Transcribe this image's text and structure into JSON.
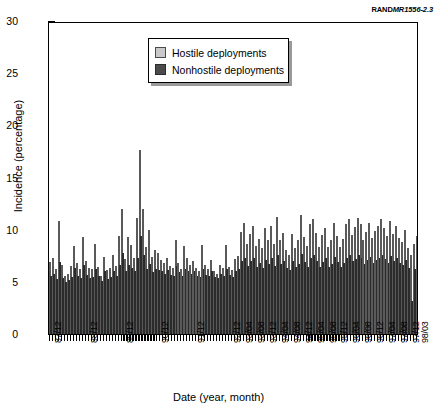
{
  "source_label": {
    "prefix": "RAND",
    "italic": "MR1556-2.3"
  },
  "chart_data": {
    "type": "bar",
    "title": "",
    "xlabel": "Date (year, month)",
    "ylabel": "Incidence (percentage)",
    "ylim": [
      0,
      30
    ],
    "ytick_labels": [
      "0",
      "5",
      "10",
      "15",
      "20",
      "25",
      "30"
    ],
    "ytick_values": [
      0,
      5,
      10,
      15,
      20,
      25,
      30
    ],
    "grid": false,
    "legend_position": "upper center",
    "legend": [
      "Hostile deployments",
      "Nonhostile deployments"
    ],
    "colors": {
      "hostile": "#c9c9c9",
      "nonhostile": "#4a4a4a"
    },
    "xtick_labels": [
      "87/12",
      "88/12",
      "89/12",
      "90/12",
      "91/12",
      "92/12",
      "93/04",
      "93/08",
      "93/12",
      "94/04",
      "94/08",
      "94/12",
      "95/04",
      "95/08",
      "95/12",
      "96/04",
      "96/08",
      "96/12",
      "97/04",
      "97/08",
      "97/12",
      "98/03"
    ],
    "categories": [
      "87/12",
      "88/01",
      "88/02",
      "88/03",
      "88/04",
      "88/05",
      "88/06",
      "88/07",
      "88/08",
      "88/09",
      "88/10",
      "88/11",
      "88/12",
      "89/01",
      "89/02",
      "89/03",
      "89/04",
      "89/05",
      "89/06",
      "89/07",
      "89/08",
      "89/09",
      "89/10",
      "89/11",
      "89/12",
      "90/01",
      "90/02",
      "90/03",
      "90/04",
      "90/05",
      "90/06",
      "90/07",
      "90/08",
      "90/09",
      "90/10",
      "90/11",
      "90/12",
      "91/01",
      "91/02",
      "91/03",
      "91/04",
      "91/05",
      "91/06",
      "91/07",
      "91/08",
      "91/09",
      "91/10",
      "91/11",
      "91/12",
      "92/01",
      "92/02",
      "92/03",
      "92/04",
      "92/05",
      "92/06",
      "92/07",
      "92/08",
      "92/09",
      "92/10",
      "92/11",
      "92/12",
      "93/01",
      "93/02",
      "93/03",
      "93/04",
      "93/05",
      "93/06",
      "93/07",
      "93/08",
      "93/09",
      "93/10",
      "93/11",
      "93/12",
      "94/01",
      "94/02",
      "94/03",
      "94/04",
      "94/05",
      "94/06",
      "94/07",
      "94/08",
      "94/09",
      "94/10",
      "94/11",
      "94/12",
      "95/01",
      "95/02",
      "95/03",
      "95/04",
      "95/05",
      "95/06",
      "95/07",
      "95/08",
      "95/09",
      "95/10",
      "95/11",
      "95/12",
      "96/01",
      "96/02",
      "96/03",
      "96/04",
      "96/05",
      "96/06",
      "96/07",
      "96/08",
      "96/09",
      "96/10",
      "96/11",
      "96/12",
      "97/01",
      "97/02",
      "97/03",
      "97/04",
      "97/05",
      "97/06",
      "97/07",
      "97/08",
      "97/09",
      "97/10",
      "97/11",
      "97/12",
      "98/01",
      "98/02",
      "98/03"
    ],
    "series": [
      {
        "name": "Hostile deployments",
        "values": [
          6.9,
          7.3,
          6.2,
          10.8,
          6.6,
          5.6,
          5.8,
          6.5,
          8.4,
          6.8,
          6.2,
          9.3,
          7.0,
          6.3,
          6.2,
          8.6,
          6.4,
          5.6,
          7.4,
          6.1,
          6.3,
          7.6,
          6.5,
          9.4,
          12.0,
          7.2,
          9.3,
          8.5,
          7.3,
          11.1,
          17.6,
          12.0,
          8.3,
          10.0,
          7.4,
          8.1,
          7.8,
          7.1,
          6.8,
          7.3,
          6.5,
          6.3,
          9.0,
          6.8,
          6.2,
          8.4,
          7.3,
          6.6,
          7.0,
          6.3,
          6.0,
          8.5,
          6.6,
          6.2,
          7.1,
          6.0,
          5.8,
          6.6,
          6.3,
          8.5,
          6.4,
          6.1,
          7.2,
          7.5,
          9.8,
          10.6,
          8.6,
          9.6,
          10.4,
          8.4,
          9.1,
          8.2,
          10.2,
          9.0,
          10.4,
          8.6,
          11.2,
          9.0,
          9.7,
          8.1,
          7.6,
          9.6,
          8.2,
          9.0,
          11.4,
          9.3,
          8.4,
          10.5,
          11.0,
          9.7,
          8.3,
          9.5,
          10.2,
          8.3,
          9.0,
          10.6,
          9.4,
          8.3,
          9.1,
          10.5,
          11.0,
          9.5,
          10.3,
          11.1,
          10.5,
          9.0,
          9.8,
          10.6,
          9.2,
          9.9,
          10.4,
          11.0,
          10.2,
          9.4,
          10.8,
          9.6,
          10.4,
          9.2,
          8.8,
          10.0,
          8.2,
          7.6,
          8.6,
          9.4
        ]
      },
      {
        "name": "Nonhostile deployments",
        "values": [
          5.6,
          5.8,
          5.3,
          6.9,
          5.4,
          5.0,
          5.2,
          5.5,
          6.3,
          5.6,
          5.4,
          6.6,
          5.7,
          5.4,
          5.5,
          6.2,
          5.6,
          5.1,
          6.0,
          5.3,
          5.5,
          6.0,
          5.6,
          6.6,
          7.8,
          6.0,
          6.6,
          6.3,
          6.0,
          7.3,
          9.4,
          7.6,
          6.2,
          6.7,
          5.9,
          6.2,
          6.1,
          6.0,
          5.8,
          6.1,
          5.7,
          5.6,
          6.5,
          5.9,
          5.6,
          6.2,
          6.0,
          5.8,
          6.0,
          5.6,
          5.5,
          6.2,
          5.7,
          5.6,
          6.0,
          5.5,
          5.4,
          5.8,
          5.6,
          6.2,
          5.7,
          5.5,
          6.0,
          6.2,
          7.0,
          7.3,
          6.5,
          7.0,
          7.3,
          6.4,
          6.8,
          6.3,
          7.1,
          6.7,
          7.3,
          6.5,
          7.6,
          6.7,
          7.0,
          6.3,
          6.1,
          7.0,
          6.4,
          6.7,
          7.7,
          6.9,
          6.4,
          7.3,
          7.6,
          7.0,
          6.4,
          6.9,
          7.3,
          6.4,
          6.7,
          7.4,
          6.9,
          6.4,
          6.8,
          7.3,
          7.6,
          7.0,
          7.2,
          7.6,
          7.3,
          6.7,
          7.1,
          7.4,
          6.8,
          7.1,
          7.3,
          7.6,
          7.2,
          6.8,
          7.5,
          7.0,
          7.3,
          6.8,
          6.6,
          7.1,
          6.3,
          3.2,
          6.2,
          6.6
        ]
      }
    ]
  }
}
